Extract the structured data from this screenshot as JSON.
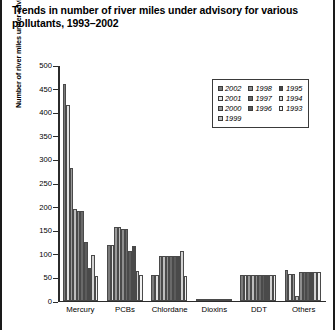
{
  "title": "Trends in number of river miles under advisory for various pollutants, 1993–2002",
  "legend": {
    "items": [
      {
        "label": "2002",
        "color": "#7b7b7b"
      },
      {
        "label": "1998",
        "color": "#8f8f8f"
      },
      {
        "label": "1995",
        "color": "#4a4a4a"
      },
      {
        "label": "2001",
        "color": "#e2e2e2"
      },
      {
        "label": "1997",
        "color": "#6a6a6a"
      },
      {
        "label": "1994",
        "color": "#d2d2d2"
      },
      {
        "label": "2000",
        "color": "#9a9a9a"
      },
      {
        "label": "1996",
        "color": "#5c5c5c"
      },
      {
        "label": "1993",
        "color": "#f2f2f2"
      },
      {
        "label": "1999",
        "color": "#bdbdbd"
      }
    ]
  },
  "chart_data": {
    "type": "bar",
    "title": "Trends in number of river miles under advisory for various pollutants, 1993–2002",
    "xlabel": "",
    "ylabel": "Number of river miles under advisory (in thousands)",
    "ylim": [
      0,
      500
    ],
    "yticks": [
      0,
      50,
      100,
      150,
      200,
      250,
      300,
      350,
      400,
      450,
      500
    ],
    "ytick_labels": [
      "0",
      "50",
      "100",
      "150",
      "200",
      "250",
      "300",
      "350",
      "400",
      "450",
      "500"
    ],
    "grid": false,
    "legend_position": "upper right",
    "categories": [
      "Mercury",
      "PCBs",
      "Chlordane",
      "Dioxins",
      "DDT",
      "Others"
    ],
    "series": [
      {
        "name": "2002",
        "color": "#7b7b7b",
        "values": [
          458,
          117,
          55,
          3,
          53,
          65
        ]
      },
      {
        "name": "2001",
        "color": "#e2e2e2",
        "values": [
          415,
          117,
          55,
          3,
          53,
          57
        ]
      },
      {
        "name": "2000",
        "color": "#9a9a9a",
        "values": [
          280,
          155,
          95,
          3,
          53,
          56
        ]
      },
      {
        "name": "1999",
        "color": "#bdbdbd",
        "values": [
          193,
          155,
          95,
          3,
          53,
          10
        ]
      },
      {
        "name": "1998",
        "color": "#8f8f8f",
        "values": [
          189,
          152,
          95,
          3,
          53,
          60
        ]
      },
      {
        "name": "1997",
        "color": "#6a6a6a",
        "values": [
          189,
          152,
          95,
          3,
          53,
          60
        ]
      },
      {
        "name": "1996",
        "color": "#5c5c5c",
        "values": [
          125,
          105,
          95,
          3,
          53,
          60
        ]
      },
      {
        "name": "1995",
        "color": "#4a4a4a",
        "values": [
          68,
          115,
          95,
          3,
          53,
          60
        ]
      },
      {
        "name": "1994",
        "color": "#d2d2d2",
        "values": [
          97,
          62,
          105,
          3,
          53,
          60
        ]
      },
      {
        "name": "1993",
        "color": "#f2f2f2",
        "values": [
          52,
          55,
          52,
          3,
          53,
          60
        ]
      }
    ]
  }
}
